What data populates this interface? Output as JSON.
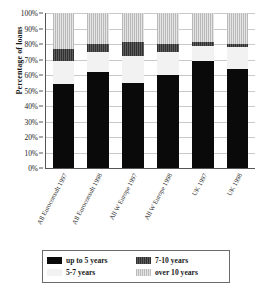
{
  "chart_data": {
    "type": "bar",
    "subtype": "100% stacked bar",
    "title": "",
    "xlabel": "",
    "ylabel": "Percentage of loans",
    "ylim": [
      0,
      100
    ],
    "ytick_labels": [
      "0%",
      "10%",
      "20%",
      "30%",
      "40%",
      "50%",
      "60%",
      "70%",
      "80%",
      "90%",
      "100%"
    ],
    "ytick_values": [
      0,
      10,
      20,
      30,
      40,
      50,
      60,
      70,
      80,
      90,
      100
    ],
    "grid": true,
    "legend_position": "bottom",
    "categories": [
      "All Euroconsult 1997",
      "All Euroconsult 1998",
      "All W Europe 1997",
      "All W Europe 1998",
      "UK 1997",
      "UK 1998"
    ],
    "series": [
      {
        "name": "up to 5 years",
        "values": [
          54,
          62,
          55,
          60,
          69,
          64
        ]
      },
      {
        "name": "5-7 years",
        "values": [
          15,
          13,
          17,
          15,
          10,
          14
        ]
      },
      {
        "name": "7-10 years",
        "values": [
          8,
          5,
          9,
          5,
          2,
          2
        ]
      },
      {
        "name": "over 10 years",
        "values": [
          23,
          20,
          19,
          20,
          19,
          20
        ]
      }
    ]
  },
  "axis": {
    "y_title": "Percentage of loans"
  },
  "legend": {
    "entries": [
      {
        "label": "up to 5 years",
        "swatch": "s0",
        "color": "#0a0a0a"
      },
      {
        "label": "7-10 years",
        "swatch": "s2",
        "color": "#4a4a4a"
      },
      {
        "label": "5-7 years",
        "swatch": "s1",
        "color": "#f2f2f2"
      },
      {
        "label": "over 10 years",
        "swatch": "s3",
        "color": "#d6d6d6"
      }
    ]
  }
}
